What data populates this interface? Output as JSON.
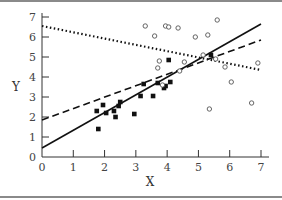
{
  "chart_data": {
    "type": "scatter",
    "title": "",
    "xlabel": "X",
    "ylabel": "Y",
    "xlim": [
      0,
      7
    ],
    "ylim": [
      0,
      7
    ],
    "x_ticks": [
      "0",
      "1",
      "2",
      "3",
      "4",
      "5",
      "6",
      "7"
    ],
    "y_ticks": [
      "0",
      "1",
      "2",
      "3",
      "4",
      "5",
      "6",
      "7"
    ],
    "grid": false,
    "legend": null,
    "series": [
      {
        "name": "filled squares",
        "marker": "square-filled",
        "points": [
          [
            1.8,
            1.4
          ],
          [
            1.75,
            2.3
          ],
          [
            1.95,
            2.6
          ],
          [
            2.05,
            2.2
          ],
          [
            2.3,
            2.3
          ],
          [
            2.35,
            2.0
          ],
          [
            2.45,
            2.55
          ],
          [
            2.5,
            2.75
          ],
          [
            2.95,
            2.15
          ],
          [
            3.15,
            3.05
          ],
          [
            3.25,
            3.65
          ],
          [
            3.55,
            3.05
          ],
          [
            3.7,
            3.7
          ],
          [
            3.9,
            3.45
          ],
          [
            3.95,
            3.55
          ],
          [
            4.05,
            4.85
          ],
          [
            4.1,
            3.75
          ],
          [
            5.4,
            5.1
          ]
        ]
      },
      {
        "name": "open circles",
        "marker": "circle-open",
        "points": [
          [
            3.3,
            6.55
          ],
          [
            3.6,
            6.05
          ],
          [
            3.7,
            4.45
          ],
          [
            3.75,
            4.8
          ],
          [
            3.85,
            3.6
          ],
          [
            3.95,
            6.55
          ],
          [
            4.05,
            6.5
          ],
          [
            4.35,
            6.45
          ],
          [
            4.4,
            4.3
          ],
          [
            4.55,
            4.75
          ],
          [
            4.9,
            6.0
          ],
          [
            5.3,
            6.1
          ],
          [
            5.55,
            4.9
          ],
          [
            5.35,
            2.4
          ],
          [
            5.6,
            6.85
          ],
          [
            5.85,
            4.5
          ],
          [
            6.05,
            3.75
          ],
          [
            6.7,
            2.7
          ],
          [
            6.9,
            4.7
          ],
          [
            5.15,
            5.1
          ]
        ]
      }
    ],
    "lines": [
      {
        "name": "solid regression line",
        "style": "solid",
        "x": [
          0,
          7
        ],
        "y": [
          0.45,
          6.65
        ]
      },
      {
        "name": "dashed regression line",
        "style": "dashed",
        "x": [
          0,
          7
        ],
        "y": [
          1.85,
          5.85
        ]
      },
      {
        "name": "dotted regression line",
        "style": "dotted",
        "x": [
          0,
          7
        ],
        "y": [
          6.55,
          4.35
        ]
      }
    ]
  },
  "colors": {
    "ink": "#111111",
    "axis": "#333333",
    "frame": "#8a8a8a"
  }
}
